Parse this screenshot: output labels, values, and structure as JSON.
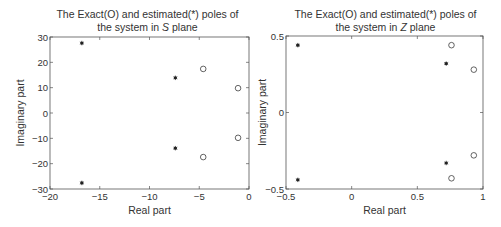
{
  "chart_data": [
    {
      "type": "scatter",
      "title_line1": "The Exact(O) and estimated(*) poles of",
      "title_line2_prefix": "the system in ",
      "title_line2_var": "S",
      "title_line2_suffix": " plane",
      "xlabel": "Real part",
      "ylabel": "Imaginary part",
      "xlim": [
        -20,
        0
      ],
      "ylim": [
        -30,
        30
      ],
      "xticks": [
        -20,
        -15,
        -10,
        -5,
        0
      ],
      "xtick_labels": [
        "−20",
        "−15",
        "−10",
        "−5",
        "0"
      ],
      "yticks": [
        -30,
        -20,
        -10,
        0,
        10,
        20,
        30
      ],
      "ytick_labels": [
        "−30",
        "−20",
        "−10",
        "0",
        "10",
        "20",
        "30"
      ],
      "grid": false,
      "series": [
        {
          "name": "Exact (O)",
          "marker": "circle",
          "points": [
            [
              -4.6,
              17.4
            ],
            [
              -4.6,
              -17.4
            ],
            [
              -1.1,
              9.8
            ],
            [
              -1.1,
              -9.8
            ]
          ]
        },
        {
          "name": "Estimated (*)",
          "marker": "star",
          "points": [
            [
              -16.8,
              27.6
            ],
            [
              -16.8,
              -27.6
            ],
            [
              -7.4,
              13.9
            ],
            [
              -7.4,
              -13.9
            ]
          ]
        }
      ]
    },
    {
      "type": "scatter",
      "title_line1": "The Exact(O) and estimated(*) poles of",
      "title_line2_prefix": "the system in ",
      "title_line2_var": "Z",
      "title_line2_suffix": " plane",
      "xlabel": "Real part",
      "ylabel": "Imaginary part",
      "xlim": [
        -0.5,
        1
      ],
      "ylim": [
        -0.5,
        0.5
      ],
      "xticks": [
        -0.5,
        0,
        0.5,
        1
      ],
      "xtick_labels": [
        "−0.5",
        "0",
        "0.5",
        "1"
      ],
      "yticks": [
        -0.5,
        0,
        0.5
      ],
      "ytick_labels": [
        "−0.5",
        "0",
        "0.5"
      ],
      "grid": false,
      "series": [
        {
          "name": "Exact (O)",
          "marker": "circle",
          "points": [
            [
              0.76,
              0.44
            ],
            [
              0.76,
              -0.43
            ],
            [
              0.93,
              0.28
            ],
            [
              0.93,
              -0.28
            ]
          ]
        },
        {
          "name": "Estimated (*)",
          "marker": "star",
          "points": [
            [
              -0.41,
              0.44
            ],
            [
              -0.41,
              -0.44
            ],
            [
              0.72,
              0.32
            ],
            [
              0.72,
              -0.33
            ]
          ]
        }
      ]
    }
  ],
  "layout": {
    "frames": [
      {
        "left": 50,
        "top": 37,
        "right": 249,
        "bottom": 189
      },
      {
        "left": 286,
        "top": 36,
        "right": 483,
        "bottom": 189
      }
    ],
    "colors": {
      "axis": "#555555",
      "marker": "#222222",
      "text": "#333333"
    }
  }
}
